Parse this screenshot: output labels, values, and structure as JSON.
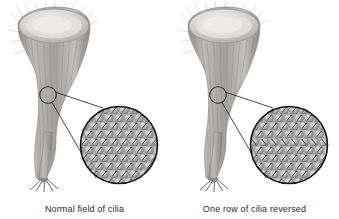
{
  "figure": {
    "background_color": "#ffffff",
    "width": 339,
    "height": 219
  },
  "panels": [
    {
      "id": "normal",
      "caption": "Normal field of cilia",
      "organism_label": "ciliated funnel-shaped protozoan",
      "callout": {
        "source_circle_label": "sampled patch of body surface",
        "magnified_circle_label": "magnified cilia field",
        "leader_line_count": 2
      },
      "cilia_field": {
        "arrangement": "staggered rows of rounded cells",
        "rows": 10,
        "columns": 8,
        "beat_direction": "uniform, all cilia angled the same way",
        "reversed_row_index": null
      }
    },
    {
      "id": "reversed",
      "caption": "One row of cilia reversed",
      "organism_label": "ciliated funnel-shaped protozoan",
      "callout": {
        "source_circle_label": "sampled patch of body surface",
        "magnified_circle_label": "magnified cilia field",
        "leader_line_count": 2
      },
      "cilia_field": {
        "arrangement": "staggered rows of rounded cells",
        "rows": 10,
        "columns": 8,
        "beat_direction": "uniform except one row beating opposite",
        "reversed_row_index": 4
      }
    }
  ],
  "colors": {
    "outline": "#1a1a1a",
    "caption_text": "#2b2b2b",
    "cell_fill_light": "#d8d8d8",
    "cell_fill_mid": "#b0b0b0",
    "cell_fill_dark": "#8a8a8a",
    "organism_body": "#9a9a9a",
    "organism_rim": "#cfcfcf"
  }
}
